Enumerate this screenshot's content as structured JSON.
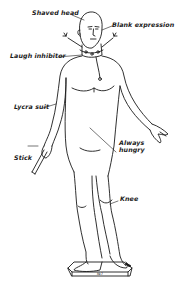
{
  "figure": {
    "stroke_color": "#1a1a1a",
    "background": "#ffffff",
    "pedestal_mark": "№7"
  },
  "labels": [
    {
      "id": "shaved-head",
      "text": "Shaved head"
    },
    {
      "id": "blank-expression",
      "text": "Blank expression"
    },
    {
      "id": "laugh-inhibitor",
      "text": "Laugh inhibitor"
    },
    {
      "id": "lycra-suit",
      "text": "Lycra suit"
    },
    {
      "id": "always-hungry",
      "text": "Always\nhungry"
    },
    {
      "id": "stick",
      "text": "Stick"
    },
    {
      "id": "knee",
      "text": "Knee"
    }
  ]
}
